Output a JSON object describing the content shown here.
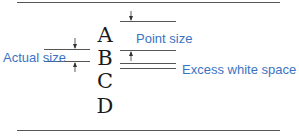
{
  "diagram": {
    "letters": [
      "A",
      "B",
      "C",
      "D"
    ],
    "labels": {
      "point_size": "Point size",
      "actual_size": "Actual size",
      "excess_white_space": "Excess white space"
    },
    "colors": {
      "label": "#3a73c4",
      "line": "#555555",
      "letter": "#1a1a1a"
    }
  }
}
